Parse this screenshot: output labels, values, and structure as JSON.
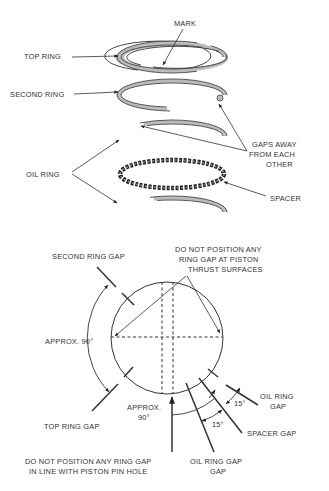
{
  "figure": {
    "top_section": {
      "labels": {
        "mark": "MARK",
        "top_ring": "TOP RING",
        "second_ring": "SECOND RING",
        "oil_ring": "OIL RING",
        "gaps_away_1": "GAPS AWAY",
        "gaps_away_2": "FROM EACH",
        "gaps_away_3": "OTHER",
        "spacer": "SPACER"
      }
    },
    "bottom_section": {
      "labels": {
        "second_ring_gap": "SECOND RING GAP",
        "thrust_1": "DO NOT POSITION ANY",
        "thrust_2": "RING GAP AT PISTON",
        "thrust_3": "THRUST SURFACES",
        "approx_left": "APPROX. 90°",
        "approx_bottom_1": "APPROX.",
        "approx_bottom_2": "90°",
        "top_ring_gap": "TOP RING GAP",
        "oil_ring_gap_right_1": "OIL RING",
        "oil_ring_gap_right_2": "GAP",
        "angle_upper": "15°",
        "angle_lower": "15°",
        "spacer_gap": "SPACER GAP",
        "pin_hole_1": "DO NOT POSITION ANY RING GAP",
        "pin_hole_2": "IN LINE WITH PISTON PIN HOLE",
        "oil_ring_gap_bottom_1": "OIL RING GAP",
        "oil_ring_gap_bottom_2": "GAP"
      }
    }
  }
}
